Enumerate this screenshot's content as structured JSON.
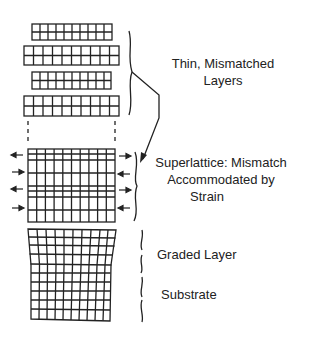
{
  "diagram": {
    "type": "layer-structure schematic",
    "colors": {
      "line": "#222222",
      "background": "#ffffff"
    },
    "labels": {
      "thin_layers": {
        "line1": "Thin, Mismatched",
        "line2": "Layers"
      },
      "superlattice": {
        "line1": "Superlattice: Mismatch",
        "line2": "Accommodated by",
        "line3": "Strain"
      },
      "graded_layer": "Graded Layer",
      "substrate": "Substrate"
    },
    "thin_layers": [
      {
        "name": "layer-1",
        "width": "narrow",
        "columns": 10,
        "rows": 2
      },
      {
        "name": "layer-2",
        "width": "wide",
        "columns": 10,
        "rows": 2
      },
      {
        "name": "layer-3",
        "width": "narrow",
        "columns": 10,
        "rows": 2
      },
      {
        "name": "layer-4",
        "width": "wide",
        "columns": 10,
        "rows": 2
      }
    ],
    "superlattice": {
      "columns": 10,
      "rows": 10,
      "strain_arrows_per_side": 4
    },
    "graded_substrate": {
      "columns": 10,
      "rows": 12
    }
  }
}
